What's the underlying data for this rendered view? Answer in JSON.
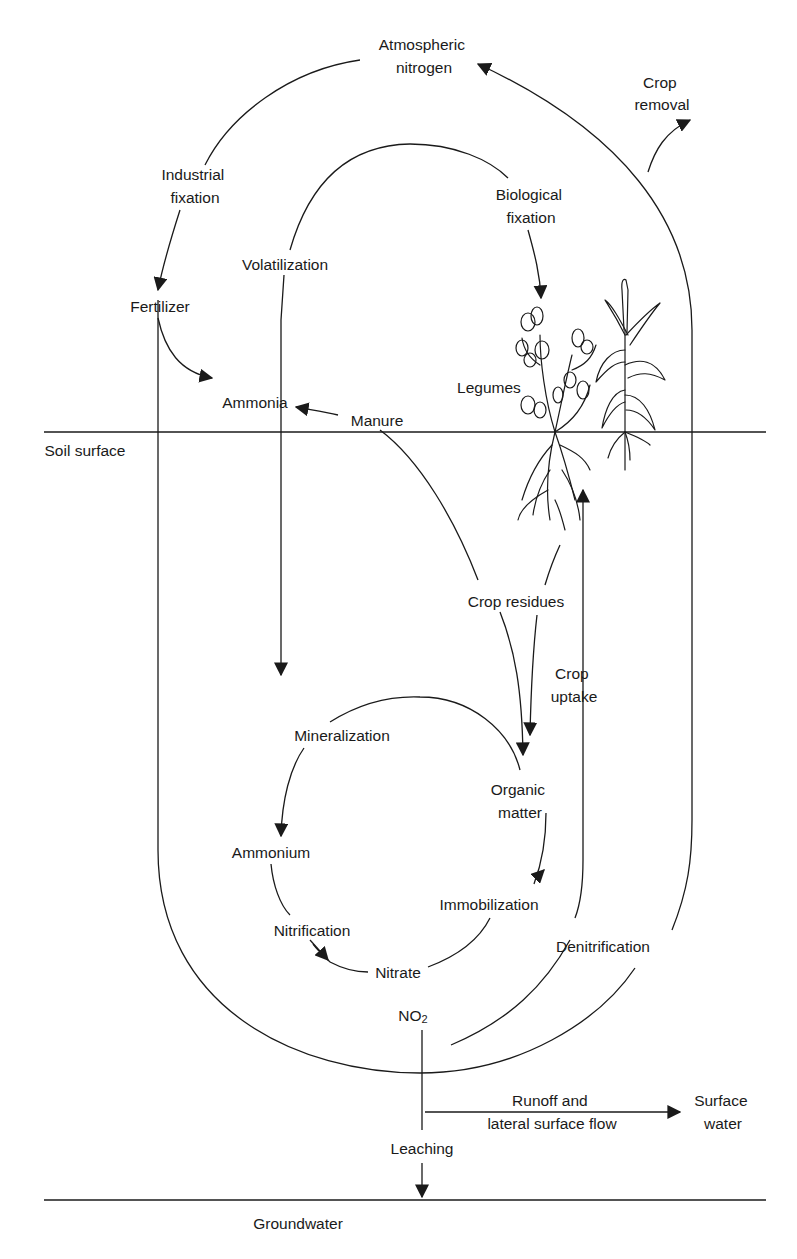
{
  "diagram": {
    "type": "nitrogen-cycle",
    "boundaries": {
      "soil_surface": "Soil surface",
      "groundwater": "Groundwater"
    },
    "nodes": {
      "atmospheric_nitrogen": [
        "Atmospheric",
        "nitrogen"
      ],
      "crop_removal": [
        "Crop",
        "removal"
      ],
      "industrial_fixation": [
        "Industrial",
        "fixation"
      ],
      "biological_fixation": [
        "Biological",
        "fixation"
      ],
      "volatilization": "Volatilization",
      "fertilizer": "Fertilizer",
      "ammonia": "Ammonia",
      "manure": "Manure",
      "legumes": "Legumes",
      "crop_residues": "Crop residues",
      "crop_uptake": [
        "Crop",
        "uptake"
      ],
      "mineralization": "Mineralization",
      "organic_matter": [
        "Organic",
        "matter"
      ],
      "ammonium": "Ammonium",
      "immobilization": "Immobilization",
      "nitrification": "Nitrification",
      "denitrification": "Denitrification",
      "nitrate": "Nitrate",
      "no2": {
        "base": "NO",
        "subscript": "2"
      },
      "runoff": [
        "Runoff and",
        "lateral surface flow"
      ],
      "surface_water": [
        "Surface",
        "water"
      ],
      "leaching": "Leaching"
    },
    "flows": [
      {
        "from": "Atmospheric nitrogen",
        "to": "Fertilizer",
        "label": "Industrial fixation"
      },
      {
        "from": "Atmospheric nitrogen",
        "to": "Legumes",
        "label": "Biological fixation"
      },
      {
        "from": "Crops",
        "to": "Atmospheric nitrogen",
        "label": "Denitrification"
      },
      {
        "from": "Crops",
        "to": "Crop removal",
        "label": "Crop removal"
      },
      {
        "from": "Fertilizer",
        "to": "Ammonia"
      },
      {
        "from": "Manure",
        "to": "Ammonia"
      },
      {
        "from": "Ammonia",
        "to": "Ammonium",
        "label": "Volatilization"
      },
      {
        "from": "Manure",
        "to": "Organic matter"
      },
      {
        "from": "Legumes",
        "to": "Organic matter",
        "label": "Crop residues"
      },
      {
        "from": "Nitrate",
        "to": "Crops",
        "label": "Crop uptake"
      },
      {
        "from": "Organic matter",
        "to": "Ammonium",
        "label": "Mineralization"
      },
      {
        "from": "Ammonium",
        "to": "Nitrate",
        "label": "Nitrification"
      },
      {
        "from": "Nitrate",
        "to": "Organic matter",
        "label": "Immobilization"
      },
      {
        "from": "NO2",
        "to": "Surface water",
        "label": "Runoff and lateral surface flow"
      },
      {
        "from": "NO2",
        "to": "Groundwater",
        "label": "Leaching"
      }
    ]
  }
}
